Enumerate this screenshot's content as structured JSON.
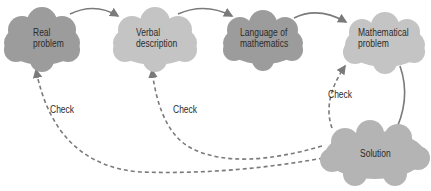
{
  "diagram": {
    "nodes": [
      {
        "id": "real",
        "line1": "Real",
        "line2": "problem",
        "color": "#9c9c9c"
      },
      {
        "id": "verbal",
        "line1": "Verbal",
        "line2": "description",
        "color": "#c4c4c4"
      },
      {
        "id": "language",
        "line1": "Language of",
        "line2": "mathematics",
        "color": "#9c9c9c"
      },
      {
        "id": "mathproblem",
        "line1": "Mathematical",
        "line2": "problem",
        "color": "#c4c4c4"
      },
      {
        "id": "solution",
        "line1": "Solution",
        "line2": "",
        "color": "#b4b4b4"
      }
    ],
    "edges": [
      {
        "from": "real",
        "to": "verbal",
        "style": "solid"
      },
      {
        "from": "verbal",
        "to": "language",
        "style": "solid"
      },
      {
        "from": "language",
        "to": "mathproblem",
        "style": "solid"
      },
      {
        "from": "mathproblem",
        "to": "solution",
        "style": "solid"
      },
      {
        "from": "solution",
        "to": "mathproblem",
        "style": "dashed",
        "label": "Check"
      },
      {
        "from": "solution",
        "to": "verbal",
        "style": "dashed",
        "label": "Check"
      },
      {
        "from": "solution",
        "to": "real",
        "style": "dashed",
        "label": "Check"
      }
    ],
    "check_labels": [
      "Check",
      "Check",
      "Check"
    ]
  }
}
